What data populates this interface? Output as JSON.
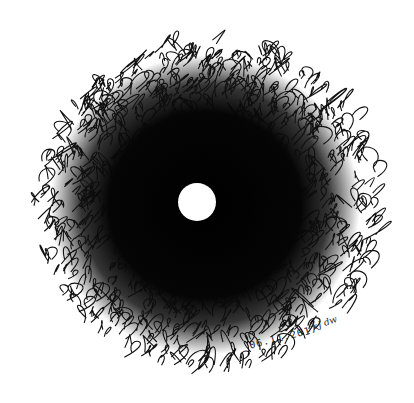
{
  "artwork": {
    "description": "Pen scribble drawing: dense dark tangled circular mass with a white circular void at the center",
    "date_text": "06.11.2017",
    "signature_text": "kJ dw",
    "colors": {
      "background": "#ffffff",
      "ink": "#111111",
      "center_dot": "#ffffff"
    },
    "center": {
      "x": 197,
      "y": 202
    },
    "center_dot_radius": 19,
    "outer_radius_x": 172,
    "outer_radius_y": 165
  }
}
